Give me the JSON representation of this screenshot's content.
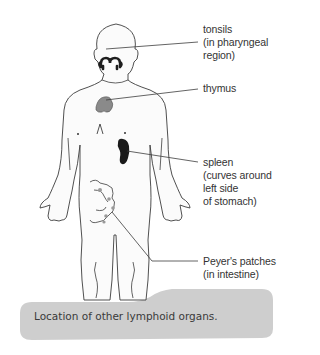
{
  "diagram": {
    "title": "Location of other lymphoid organs.",
    "labels": {
      "tonsils": "tonsils\n(in pharyngeal\nregion)",
      "thymus": "thymus",
      "spleen": "spleen\n(curves around\nleft side\nof stomach)",
      "peyers_patches": "Peyer's patches\n(in intestine)"
    },
    "colors": {
      "outline": "#3c3c3c",
      "tonsils": "#1e1e1e",
      "thymus": "#8a8a8a",
      "spleen": "#1a1a1a",
      "peyers_patches": "#9a9a9a",
      "caption_background": "#cfcfcf",
      "body_fill": "#fafafa"
    }
  }
}
